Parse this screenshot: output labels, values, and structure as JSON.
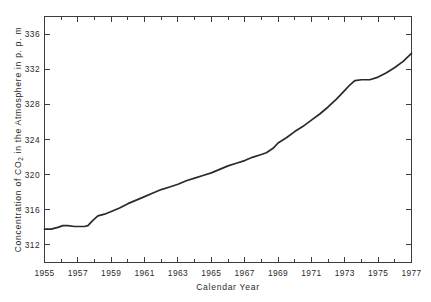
{
  "figure": {
    "background_color": "#ffffff",
    "line_color": "#2a2a2a",
    "axis_color": "#3c3c3c",
    "title": "",
    "xlabel": "Calendar  Year",
    "ylabel_parts": {
      "before": "Concentration of CO",
      "subscript": "2",
      "after": " in the Atmosphere in  p. p. m"
    },
    "ylabel_full": "Concentration of CO2 in the Atmosphere in p.p.m"
  },
  "axes": {
    "x_ticks_major": [
      1955,
      1957,
      1959,
      1961,
      1963,
      1965,
      1967,
      1969,
      1971,
      1973,
      1975,
      1977
    ],
    "x_tick_labels": [
      "1955",
      "1957",
      "1959",
      "1961",
      "1963",
      "1965",
      "1967",
      "1969",
      "1971",
      "1973",
      "1975",
      "1977"
    ],
    "x_minor_step": 1,
    "y_ticks_major": [
      312,
      316,
      320,
      324,
      328,
      332,
      336
    ],
    "y_tick_labels": [
      "312",
      "316",
      "320",
      "324",
      "328",
      "332",
      "336"
    ],
    "xlim": [
      1955,
      1977
    ],
    "ylim": [
      310.0,
      338.0
    ],
    "ticks_direction": "inward",
    "frame": "full-box",
    "grid": false,
    "legend": false
  },
  "chart_data": {
    "type": "line",
    "title": "",
    "xlabel": "Calendar  Year",
    "ylabel": "Concentration of CO2 in the Atmosphere in p.p.m",
    "xlim": [
      1955,
      1977
    ],
    "ylim": [
      310.0,
      338.0
    ],
    "grid": false,
    "legend_position": "none",
    "series": [
      {
        "name": "Atmospheric CO2 concentration",
        "color": "#2a2a2a",
        "x": [
          1955.0,
          1955.4,
          1955.8,
          1956.1,
          1956.4,
          1956.8,
          1957.1,
          1957.4,
          1957.6,
          1957.9,
          1958.2,
          1958.6,
          1959.0,
          1959.5,
          1960.0,
          1960.5,
          1961.0,
          1961.5,
          1962.0,
          1962.5,
          1963.0,
          1963.5,
          1964.0,
          1964.5,
          1965.0,
          1965.5,
          1966.0,
          1966.5,
          1967.0,
          1967.5,
          1968.0,
          1968.3,
          1968.7,
          1969.0,
          1969.5,
          1970.0,
          1970.5,
          1971.0,
          1971.5,
          1972.0,
          1972.5,
          1973.0,
          1973.3,
          1973.6,
          1974.0,
          1974.5,
          1975.0,
          1975.5,
          1976.0,
          1976.5,
          1977.0
        ],
        "y": [
          313.8,
          313.8,
          314.0,
          314.2,
          314.2,
          314.1,
          314.1,
          314.1,
          314.2,
          314.8,
          315.3,
          315.5,
          315.8,
          316.2,
          316.7,
          317.1,
          317.5,
          317.9,
          318.3,
          318.6,
          318.9,
          319.3,
          319.6,
          319.9,
          320.2,
          320.6,
          321.0,
          321.3,
          321.6,
          322.0,
          322.3,
          322.5,
          323.0,
          323.6,
          324.2,
          324.9,
          325.5,
          326.2,
          326.9,
          327.7,
          328.6,
          329.6,
          330.2,
          330.7,
          330.8,
          330.8,
          331.1,
          331.6,
          332.2,
          332.9,
          333.8
        ]
      }
    ]
  }
}
